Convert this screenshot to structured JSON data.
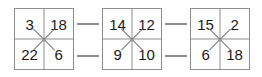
{
  "figure": {
    "type": "number-grid-puzzle",
    "grid_count": 3,
    "colors": {
      "background": "#ffffff",
      "grid_line": "#8e8e8e",
      "cross_mark": "#7a7a7a",
      "text": "#1b1b1b",
      "connector": "#8e8e8e"
    },
    "grids": [
      {
        "name": "grid-1",
        "cells": [
          {
            "position": "top-left",
            "value": "3"
          },
          {
            "position": "top-right",
            "value": "18"
          },
          {
            "position": "bottom-left",
            "value": "22"
          },
          {
            "position": "bottom-right",
            "value": "6"
          }
        ],
        "center_mark": "x-cross"
      },
      {
        "name": "grid-2",
        "cells": [
          {
            "position": "top-left",
            "value": "14"
          },
          {
            "position": "top-right",
            "value": "12"
          },
          {
            "position": "bottom-left",
            "value": "9"
          },
          {
            "position": "bottom-right",
            "value": "10"
          }
        ],
        "center_mark": "x-cross"
      },
      {
        "name": "grid-3",
        "cells": [
          {
            "position": "top-left",
            "value": "15"
          },
          {
            "position": "top-right",
            "value": "2"
          },
          {
            "position": "bottom-left",
            "value": "6"
          },
          {
            "position": "bottom-right",
            "value": "18"
          }
        ],
        "center_mark": "x-cross"
      }
    ],
    "connectors": [
      {
        "name": "connector-top-left",
        "between": "grid-1 / grid-2"
      },
      {
        "name": "connector-bottom-left",
        "between": "grid-1 / grid-2"
      },
      {
        "name": "connector-top-right",
        "between": "grid-2 / grid-3"
      },
      {
        "name": "connector-bottom-right",
        "between": "grid-2 / grid-3"
      }
    ]
  }
}
